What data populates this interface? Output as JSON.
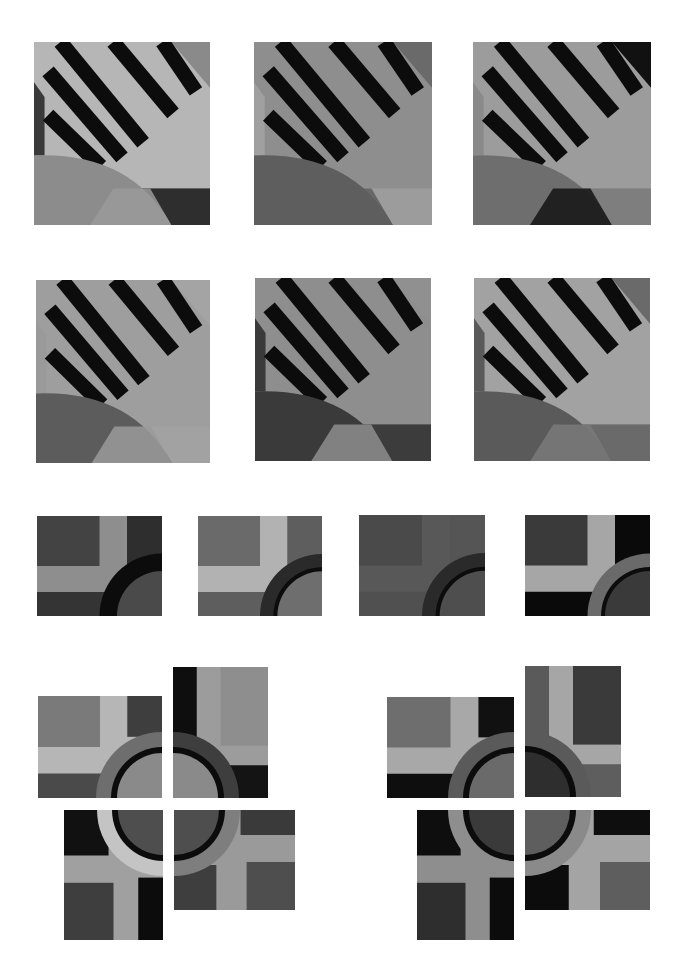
{
  "page": {
    "background": "#ffffff",
    "width": 687,
    "height": 978
  },
  "palette": {
    "black": "#0c0c0c",
    "dark": "#3e3e3e",
    "mid_dark": "#5a5a5a",
    "mid": "#7c7c7c",
    "mid_light": "#9a9a9a",
    "light": "#b4b4b4",
    "pale": "#c8c8c8"
  },
  "stripe_tiles": [
    {
      "id": "stripe-1",
      "x": 34,
      "y": 42,
      "w": 176,
      "h": 183,
      "bg": "#b6b6b6",
      "left_band": "#3a3a3a",
      "left_band_light": "#a8a8a8",
      "corner": "#8a8a8a",
      "arc_fill": "#8c8c8c",
      "arc_inner": "#9a9a9a",
      "br_block": "#2e2e2e",
      "bl_block": "#8c8c8c"
    },
    {
      "id": "stripe-2",
      "x": 254,
      "y": 42,
      "w": 178,
      "h": 183,
      "bg": "#8e8e8e",
      "left_band": "#a0a0a0",
      "left_band_light": "#9a9a9a",
      "corner": "#6a6a6a",
      "arc_fill": "#5e5e5e",
      "arc_inner": "#5e5e5e",
      "br_block": "#9c9c9c",
      "bl_block": "#5e5e5e"
    },
    {
      "id": "stripe-3",
      "x": 473,
      "y": 42,
      "w": 178,
      "h": 183,
      "bg": "#9c9c9c",
      "left_band": "#8a8a8a",
      "left_band_light": "#a8a8a8",
      "corner": "#111111",
      "arc_fill": "#6e6e6e",
      "arc_inner": "#141414",
      "br_block": "#7e7e7e",
      "bl_block": "#6e6e6e"
    },
    {
      "id": "stripe-4",
      "x": 36,
      "y": 280,
      "w": 174,
      "h": 183,
      "bg": "#9e9e9e",
      "left_band": "#9a9a9a",
      "left_band_light": "#a6a6a6",
      "corner": "#a4a4a4",
      "arc_fill": "#5c5c5c",
      "arc_inner": "#9a9a9a",
      "br_block": "#a2a2a2",
      "bl_block": "#5c5c5c"
    },
    {
      "id": "stripe-5",
      "x": 255,
      "y": 278,
      "w": 176,
      "h": 183,
      "bg": "#8e8e8e",
      "left_band": "#3a3a3a",
      "left_band_light": "#8e8e8e",
      "corner": "#909090",
      "arc_fill": "#3a3a3a",
      "arc_inner": "#8e8e8e",
      "br_block": "#3c3c3c",
      "bl_block": "#3a3a3a"
    },
    {
      "id": "stripe-6",
      "x": 474,
      "y": 278,
      "w": 176,
      "h": 183,
      "bg": "#a2a2a2",
      "left_band": "#5a5a5a",
      "left_band_light": "#a2a2a2",
      "corner": "#6a6a6a",
      "arc_fill": "#5a5a5a",
      "arc_inner": "#7a7a7a",
      "br_block": "#6a6a6a",
      "bl_block": "#5a5a5a"
    }
  ],
  "ring_tiles": [
    {
      "id": "ring-1",
      "x": 37,
      "y": 516,
      "w": 125,
      "h": 100,
      "tl": "#434343",
      "band": "#8e8e8e",
      "tr": "#2e2e2e",
      "bottom": "#343434",
      "ring": "#0c0c0c",
      "disc": "#4a4a4a"
    },
    {
      "id": "ring-2",
      "x": 198,
      "y": 516,
      "w": 124,
      "h": 100,
      "tl": "#6a6a6a",
      "band": "#b2b2b2",
      "tr": "#5e5e5e",
      "bottom": "#5e5e5e",
      "ring": "#2a2a2a",
      "disc": "#6e6e6e",
      "ring_inner": "#0c0c0c"
    },
    {
      "id": "ring-3",
      "x": 359,
      "y": 515,
      "w": 126,
      "h": 101,
      "tl": "#4a4a4a",
      "band": "#585858",
      "tr": "#555555",
      "bottom": "#505050",
      "ring": "#2a2a2a",
      "disc": "#4e4e4e",
      "ring_inner": "#0c0c0c"
    },
    {
      "id": "ring-4",
      "x": 525,
      "y": 515,
      "w": 125,
      "h": 101,
      "tl": "#3a3a3a",
      "band": "#a6a6a6",
      "tr": "#0a0a0a",
      "bottom": "#0a0a0a",
      "ring": "#6a6a6a",
      "disc": "#3a3a3a",
      "ring_inner": "#0c0c0c"
    }
  ],
  "clusters": [
    {
      "id": "cluster-left",
      "center_x": 167,
      "center_y": 798,
      "gap": 10,
      "ring_outer": 66,
      "ring_mid": 51,
      "ring_inner": 45,
      "quadrants": {
        "tl": {
          "x": 38,
          "y": 696,
          "w": 124,
          "h": 102,
          "a": "#7a7a7a",
          "band": "#b6b6b6",
          "c": "#3e3e3e",
          "d": "#4a4a4a",
          "ring": "#6e6e6e",
          "disc": "#8a8a8a"
        },
        "tr": {
          "x": 173,
          "y": 667,
          "w": 95,
          "h": 131,
          "a": "#0e0e0e",
          "band": "#9c9c9c",
          "c": "#8e8e8e",
          "d": "#141414",
          "ring": "#3e3e3e",
          "disc": "#8a8a8a"
        },
        "bl": {
          "x": 64,
          "y": 810,
          "w": 99,
          "h": 130,
          "a": "#111111",
          "band": "#a0a0a0",
          "c": "#3e3e3e",
          "d": "#0c0c0c",
          "ring": "#c4c4c4",
          "disc": "#4e4e4e"
        },
        "br": {
          "x": 174,
          "y": 810,
          "w": 121,
          "h": 100,
          "a": "#3e3e3e",
          "band": "#9a9a9a",
          "c": "#4e4e4e",
          "d": "#3a3a3a",
          "ring": "#7e7e7e",
          "disc": "#4e4e4e"
        }
      }
    },
    {
      "id": "cluster-right",
      "center_x": 519,
      "center_y": 798,
      "gap": 10,
      "ring_outer": 66,
      "ring_mid": 51,
      "ring_inner": 45,
      "quadrants": {
        "tl": {
          "x": 387,
          "y": 697,
          "w": 127,
          "h": 101,
          "a": "#6e6e6e",
          "band": "#a8a8a8",
          "c": "#111111",
          "d": "#0e0e0e",
          "ring": "#5a5a5a",
          "disc": "#6a6a6a"
        },
        "tr": {
          "x": 525,
          "y": 666,
          "w": 96,
          "h": 131,
          "a": "#5a5a5a",
          "band": "#a6a6a6",
          "c": "#3a3a3a",
          "d": "#5e5e5e",
          "ring": "#5a5a5a",
          "disc": "#2e2e2e"
        },
        "bl": {
          "x": 417,
          "y": 810,
          "w": 97,
          "h": 130,
          "a": "#0e0e0e",
          "band": "#8e8e8e",
          "c": "#2e2e2e",
          "d": "#0c0c0c",
          "ring": "#8e8e8e",
          "disc": "#3a3a3a"
        },
        "br": {
          "x": 525,
          "y": 810,
          "w": 125,
          "h": 100,
          "a": "#0c0c0c",
          "band": "#a4a4a4",
          "c": "#5e5e5e",
          "d": "#0e0e0e",
          "ring": "#8a8a8a",
          "disc": "#5e5e5e"
        }
      }
    }
  ]
}
